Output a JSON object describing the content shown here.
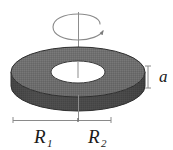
{
  "figure": {
    "background_color": "#ffffff",
    "width": 173,
    "height": 150
  },
  "labels": {
    "thickness": {
      "text": "a",
      "sub": "",
      "meaning": "disk thickness",
      "x": 163,
      "y": 77
    },
    "inner_radius": {
      "text": "R",
      "sub": "1",
      "meaning": "inner radius",
      "x": 44,
      "y": 140
    },
    "outer_radius": {
      "text": "R",
      "sub": "2",
      "meaning": "outer radius",
      "x": 97,
      "y": 140
    }
  },
  "geometry": {
    "disk": {
      "center_x": 78,
      "top_face_center_y": 72,
      "outer_rx": 67,
      "outer_ry": 25,
      "inner_rx": 27,
      "inner_ry": 11,
      "thickness_px": 22
    },
    "axis": {
      "x": 78,
      "top_y": 12,
      "bottom_y": 120
    },
    "rotation_arrow": {
      "type": "spiral-ellipse",
      "center_x": 78,
      "center_y": 30,
      "rx": 26,
      "ry": 10,
      "direction": "counter-clockwise-viewed-from-above"
    },
    "thickness_measure": {
      "x": 148,
      "top_y": 66,
      "bottom_y": 88,
      "tick_halfwidth": 3
    },
    "radius_measure": {
      "left_x": 13,
      "right_x": 111,
      "y": 120,
      "center_tick_x": 78,
      "tick_halfheight": 3
    }
  },
  "colors": {
    "top_face": "#6f6f6f",
    "top_face_light": "#7d7d7d",
    "side_wall": "#4b4b4b",
    "side_wall_dark": "#3c3c3c",
    "hole": "#ffffff",
    "outline": "#2b2b2b",
    "axis_line": "#8a8a8a",
    "measure_line": "#8a8a8a",
    "text": "#1a1a1a"
  }
}
